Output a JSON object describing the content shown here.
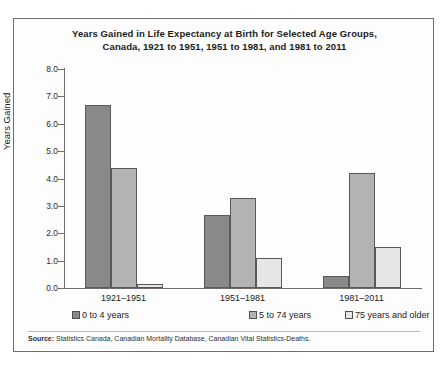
{
  "figure": {
    "title_line1": "Years Gained in Life Expectancy at Birth for Selected Age Groups,",
    "title_line2": "Canada, 1921 to 1951, 1951 to 1981, and 1981 to 2011",
    "source_label": "Source:",
    "source_text": " Statistics Canada, Canadian Mortality Database, Canadian Vital Statistics-Deaths."
  },
  "colors": {
    "series_0": "#898989",
    "series_1": "#b3b3b3",
    "series_2": "#e6e6e6",
    "bar_border": "#595959",
    "axis": "#6d6d6d",
    "frame": "#6e6e6e",
    "text": "#1b1b1b"
  },
  "chart_data": {
    "type": "bar",
    "title": "Years Gained in Life Expectancy at Birth for Selected Age Groups, Canada, 1921 to 1951, 1951 to 1981, and 1981 to 2011",
    "xlabel": "",
    "ylabel": "Years Gained",
    "ylim": [
      0.0,
      8.0
    ],
    "ytick_step": 1.0,
    "ytick_labels": [
      "0.0",
      "1.0",
      "2.0",
      "3.0",
      "4.0",
      "5.0",
      "6.0",
      "7.0",
      "8.0"
    ],
    "ytick_values": [
      0.0,
      1.0,
      2.0,
      3.0,
      4.0,
      5.0,
      6.0,
      7.0,
      8.0
    ],
    "grid": false,
    "legend_position": "bottom",
    "categories": [
      "1921–1951",
      "1951–1981",
      "1981–2011"
    ],
    "series": [
      {
        "name": "0 to 4 years",
        "values": [
          6.7,
          2.65,
          0.45
        ]
      },
      {
        "name": "5 to 74 years",
        "values": [
          4.4,
          3.3,
          4.2
        ]
      },
      {
        "name": "75 years and older",
        "values": [
          0.15,
          1.1,
          1.5
        ]
      }
    ]
  }
}
